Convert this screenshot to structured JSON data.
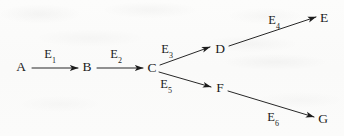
{
  "figure": {
    "kind": "directed-graph",
    "background_color": "#fbfbfa",
    "ink_color": "#1c1c1c"
  },
  "nodes": [
    {
      "id": "A",
      "label": "A",
      "x": 21,
      "y": 67
    },
    {
      "id": "B",
      "label": "B",
      "x": 87,
      "y": 67
    },
    {
      "id": "C",
      "label": "C",
      "x": 152,
      "y": 68
    },
    {
      "id": "D",
      "label": "D",
      "x": 220,
      "y": 49
    },
    {
      "id": "E",
      "label": "E",
      "x": 324,
      "y": 18
    },
    {
      "id": "F",
      "label": "F",
      "x": 220,
      "y": 88
    },
    {
      "id": "G",
      "label": "G",
      "x": 323,
      "y": 119
    }
  ],
  "edges": [
    {
      "id": "E1",
      "from": "A",
      "to": "B",
      "base": "E",
      "sub": "1",
      "label_x": 50,
      "label_y": 56,
      "x1": 32,
      "y1": 68,
      "x2": 78,
      "y2": 68
    },
    {
      "id": "E2",
      "from": "B",
      "to": "C",
      "base": "E",
      "sub": "2",
      "label_x": 116,
      "label_y": 56,
      "x1": 97,
      "y1": 68,
      "x2": 143,
      "y2": 68
    },
    {
      "id": "E3",
      "from": "C",
      "to": "D",
      "base": "E",
      "sub": "3",
      "label_x": 167,
      "label_y": 51,
      "x1": 160,
      "y1": 65,
      "x2": 210,
      "y2": 47
    },
    {
      "id": "E4",
      "from": "D",
      "to": "E",
      "base": "E",
      "sub": "4",
      "label_x": 274,
      "label_y": 22,
      "x1": 229,
      "y1": 46,
      "x2": 316,
      "y2": 17
    },
    {
      "id": "E5",
      "from": "C",
      "to": "F",
      "base": "E",
      "sub": "5",
      "label_x": 166,
      "label_y": 86,
      "x1": 159,
      "y1": 72,
      "x2": 211,
      "y2": 87
    },
    {
      "id": "E6",
      "from": "F",
      "to": "G",
      "base": "E",
      "sub": "6",
      "label_x": 273,
      "label_y": 119,
      "x1": 228,
      "y1": 91,
      "x2": 314,
      "y2": 117
    }
  ]
}
